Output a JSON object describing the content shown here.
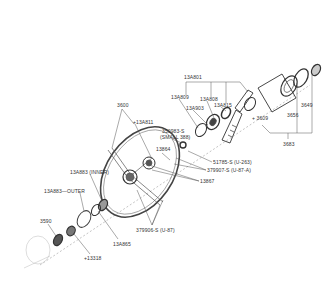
{
  "diagram": {
    "colors": {
      "background": "#ffffff",
      "line": "#555555",
      "text": "#333333"
    },
    "labels": [
      {
        "id": "13A801",
        "text": "13A801",
        "x": 184,
        "y": 74
      },
      {
        "id": "13A809",
        "text": "13A809",
        "x": 171,
        "y": 95
      },
      {
        "id": "13A808",
        "text": "13A808",
        "x": 199,
        "y": 97
      },
      {
        "id": "13A903",
        "text": "13A903",
        "x": 186,
        "y": 106
      },
      {
        "id": "13A815",
        "text": "13A815",
        "x": 215,
        "y": 103
      },
      {
        "id": "3649",
        "text": "3649",
        "x": 300,
        "y": 103
      },
      {
        "id": "3656",
        "text": "3656",
        "x": 287,
        "y": 112
      },
      {
        "id": "3609",
        "text": "+ 3609",
        "x": 253,
        "y": 116
      },
      {
        "id": "3683",
        "text": "3683",
        "x": 284,
        "y": 141
      },
      {
        "id": "3600",
        "text": "3600",
        "x": 118,
        "y": 103
      },
      {
        "id": "13A811",
        "text": "+13A811",
        "x": 135,
        "y": 120
      },
      {
        "id": "350983",
        "text": "350983-S",
        "x": 163,
        "y": 129
      },
      {
        "id": "350983-note",
        "text": "(SMALL 388)",
        "x": 161,
        "y": 135
      },
      {
        "id": "13864",
        "text": "13864",
        "x": 157,
        "y": 147
      },
      {
        "id": "51785",
        "text": "51785-S (U-263)",
        "x": 214,
        "y": 160
      },
      {
        "id": "379907",
        "text": "379907-S (U-87-A)",
        "x": 208,
        "y": 168
      },
      {
        "id": "13867",
        "text": "13867",
        "x": 201,
        "y": 179
      },
      {
        "id": "13A883-inner",
        "text": "13A883 (INNER)",
        "x": 71,
        "y": 170
      },
      {
        "id": "13A883-outer",
        "text": "13A883—OUTER",
        "x": 45,
        "y": 189
      },
      {
        "id": "379906",
        "text": "379906-S (U-87)",
        "x": 137,
        "y": 228
      },
      {
        "id": "3590",
        "text": "3590",
        "x": 40,
        "y": 218
      },
      {
        "id": "13A865",
        "text": "13A865",
        "x": 113,
        "y": 241
      },
      {
        "id": "13318",
        "text": "+13318",
        "x": 85,
        "y": 256
      }
    ]
  }
}
